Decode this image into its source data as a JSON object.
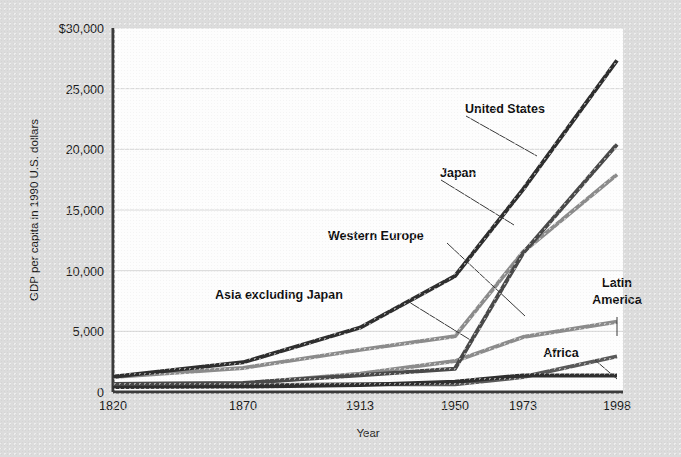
{
  "figure": {
    "background_color": "#dcdcdc",
    "plot_background_color": "#fdfdfd"
  },
  "axes": {
    "y_title": "GDP per capita in 1990 U.S. dollars",
    "x_title": "Year",
    "y_ticks": [
      "0",
      "5,000",
      "10,000",
      "15,000",
      "20,000",
      "25,000",
      "$30,000"
    ],
    "x_ticks": [
      "1820",
      "1870",
      "1913",
      "1950",
      "1973",
      "1998"
    ]
  },
  "labels": [
    {
      "name": "united-states",
      "text": "United States"
    },
    {
      "name": "japan",
      "text": "Japan"
    },
    {
      "name": "western-europe",
      "text": "Western Europe"
    },
    {
      "name": "asia-excluding-japan",
      "text": "Asia excluding Japan"
    },
    {
      "name": "latin-america",
      "text_line1": "Latin",
      "text_line2": "America"
    },
    {
      "name": "africa",
      "text": "Africa"
    }
  ],
  "chart_data": {
    "type": "line",
    "title": "",
    "xlabel": "Year",
    "ylabel": "GDP per capita in 1990 U.S. dollars",
    "x": [
      "1820",
      "1870",
      "1913",
      "1950",
      "1973",
      "1998"
    ],
    "x_scale": "ordinal-uneven",
    "ylim": [
      0,
      30000
    ],
    "ytick_values": [
      0,
      5000,
      10000,
      15000,
      20000,
      25000,
      30000
    ],
    "grid": "horizontal",
    "legend": "inline-annotations",
    "series": [
      {
        "name": "United States",
        "color": "#2f2f2f",
        "width": 4,
        "values": [
          1257,
          2445,
          5301,
          9561,
          16689,
          27331
        ]
      },
      {
        "name": "Japan",
        "color": "#4a4a4a",
        "width": 4,
        "values": [
          669,
          737,
          1387,
          1926,
          11439,
          20410
        ]
      },
      {
        "name": "Western Europe",
        "color": "#8c8c8c",
        "width": 4,
        "values": [
          1232,
          1974,
          3473,
          4594,
          11534,
          17921
        ]
      },
      {
        "name": "Latin America",
        "color": "#8c8c8c",
        "width": 4,
        "values": [
          665,
          698,
          1511,
          2554,
          4531,
          5795
        ]
      },
      {
        "name": "Asia excluding Japan",
        "color": "#5a5a5a",
        "width": 4,
        "values": [
          575,
          543,
          640,
          635,
          1231,
          2936
        ]
      },
      {
        "name": "Africa",
        "color": "#2f2f2f",
        "width": 4,
        "values": [
          418,
          444,
          585,
          852,
          1365,
          1368
        ]
      }
    ]
  }
}
